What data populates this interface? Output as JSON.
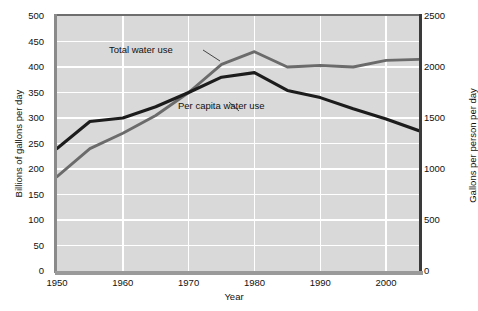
{
  "chart_data": {
    "type": "line",
    "title": "",
    "xlabel": "Year",
    "ylabel": "Billions of gallons per day",
    "ylabel_right": "Gallons per person per day",
    "xlim": [
      1950,
      2005
    ],
    "ylim": [
      0,
      500
    ],
    "ylim_right": [
      0,
      2500
    ],
    "grid": true,
    "legend_position": "inline-annotations",
    "xticks": [
      "1950",
      "1960",
      "1970",
      "1980",
      "1990",
      "2000"
    ],
    "xtick_values": [
      1950,
      1960,
      1970,
      1980,
      1990,
      2000
    ],
    "yticks_left": [
      "0",
      "50",
      "100",
      "150",
      "200",
      "250",
      "300",
      "350",
      "400",
      "450",
      "500"
    ],
    "ytick_values_left": [
      0,
      50,
      100,
      150,
      200,
      250,
      300,
      350,
      400,
      450,
      500
    ],
    "yticks_right": [
      "0",
      "500",
      "1000",
      "1500",
      "2000",
      "2500"
    ],
    "ytick_values_right": [
      0,
      500,
      1000,
      1500,
      2000,
      2500
    ],
    "series": [
      {
        "name": "Total water use",
        "axis": "left",
        "color": "#6b6b6b",
        "x": [
          1950,
          1955,
          1960,
          1965,
          1970,
          1975,
          1980,
          1985,
          1990,
          1995,
          2000,
          2005
        ],
        "values": [
          185,
          240,
          270,
          305,
          350,
          405,
          430,
          400,
          403,
          400,
          413,
          415
        ]
      },
      {
        "name": "Per capita water use",
        "axis": "right",
        "color": "#1c1c1c",
        "x": [
          1950,
          1955,
          1960,
          1965,
          1970,
          1975,
          1980,
          1985,
          1990,
          1995,
          2000,
          2005
        ],
        "values": [
          1200,
          1465,
          1500,
          1610,
          1750,
          1900,
          1945,
          1770,
          1700,
          1590,
          1490,
          1375
        ],
        "values_left_equivalent": [
          240,
          293,
          300,
          322,
          350,
          380,
          389,
          354,
          340,
          318,
          298,
          275
        ]
      }
    ],
    "annotations": [
      {
        "id": "total",
        "text": "Total water use",
        "points_to_series": "Total water use"
      },
      {
        "id": "per_capita",
        "text": "Per capita water use",
        "points_to_series": "Per capita water use"
      }
    ]
  },
  "colors": {
    "plot_background": "#d9d9d9",
    "gridline": "#ffffff",
    "total_water_use": "#6b6b6b",
    "per_capita_water_use": "#1c1c1c",
    "page_background": "#ffffff"
  }
}
